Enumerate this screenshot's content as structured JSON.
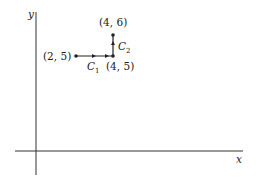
{
  "axes": {
    "x_label": "x",
    "y_label": "y"
  },
  "points": [
    {
      "label": "(2, 5)",
      "x": 2,
      "y": 5
    },
    {
      "label": "(4, 5)",
      "x": 4,
      "y": 5
    },
    {
      "label": "(4, 6)",
      "x": 4,
      "y": 6
    }
  ],
  "curves": [
    {
      "name": "C",
      "sub": "1",
      "from": "(2, 5)",
      "to": "(4, 5)",
      "direction": "right"
    },
    {
      "name": "C",
      "sub": "2",
      "from": "(4, 5)",
      "to": "(4, 6)",
      "direction": "up"
    }
  ],
  "colors": {
    "ink": "#222222",
    "background": "#ffffff"
  }
}
